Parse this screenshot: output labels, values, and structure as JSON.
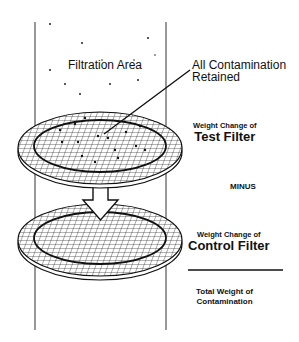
{
  "labels": {
    "filtration_area": "Filtration Area",
    "contamination_line1": "All Contamination",
    "contamination_line2": "Retained",
    "test_small": "Weight Change of",
    "test_big": "Test Filter",
    "minus": "MINUS",
    "control_small": "Weight Change of",
    "control_big": "Control Filter",
    "total_line1": "Total Weight of",
    "total_line2": "Contamination"
  },
  "components": {
    "column": "filtration-column",
    "top_disc": "test-filter-disc",
    "arrow": "down-arrow",
    "bottom_disc": "control-filter-disc",
    "divider": "sum-line"
  },
  "colors": {
    "ink": "#111111",
    "background": "#ffffff"
  }
}
